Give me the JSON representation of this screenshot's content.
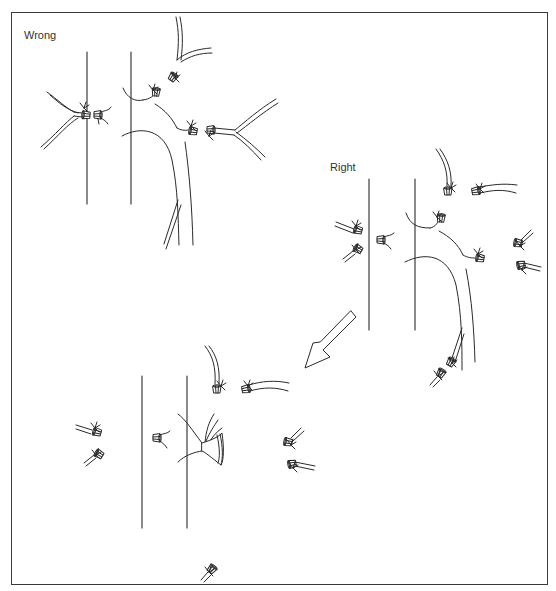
{
  "figure": {
    "panels": [
      {
        "id": "wrong",
        "label": "Wrong"
      },
      {
        "id": "right",
        "label": "Right"
      },
      {
        "id": "result",
        "label": ""
      }
    ],
    "colors": {
      "line": "#2a2a2a",
      "frame": "#3a3a3a",
      "text": "#333333",
      "background": "#ffffff"
    },
    "arrow": {
      "direction": "down-left",
      "from_panel": "right",
      "to_panel": "result"
    }
  }
}
